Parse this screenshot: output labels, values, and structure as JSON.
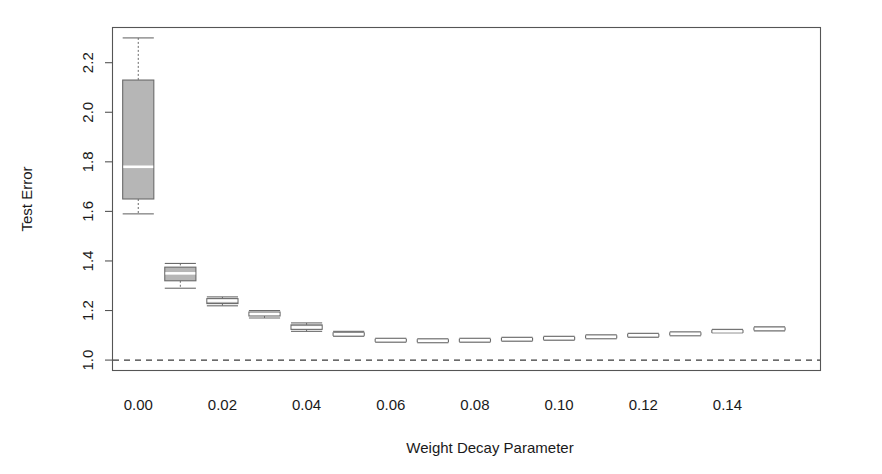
{
  "chart_data": {
    "type": "box",
    "title": "",
    "xlabel": "Weight Decay Parameter",
    "ylabel": "Test Error",
    "grid": false,
    "legend": "none",
    "xlim": [
      -0.006,
      0.162
    ],
    "ylim": [
      0.96,
      2.34
    ],
    "x_tick_labels": [
      "0.00",
      "0.02",
      "0.04",
      "0.06",
      "0.08",
      "0.10",
      "0.12",
      "0.14"
    ],
    "x_tick_values": [
      0.0,
      0.02,
      0.04,
      0.06,
      0.08,
      0.1,
      0.12,
      0.14
    ],
    "y_tick_labels": [
      "1.0",
      "1.2",
      "1.4",
      "1.6",
      "1.8",
      "2.0",
      "2.2"
    ],
    "y_tick_values": [
      1.0,
      1.2,
      1.4,
      1.6,
      1.8,
      2.0,
      2.2
    ],
    "reference_line": {
      "y": 1.0,
      "style": "dashed"
    },
    "box_width": 0.0037,
    "boxes": [
      {
        "x": 0.0,
        "whisker_low": 1.59,
        "q1": 1.65,
        "median": 1.78,
        "q3": 2.13,
        "whisker_high": 2.3
      },
      {
        "x": 0.01,
        "whisker_low": 1.29,
        "q1": 1.32,
        "median": 1.35,
        "q3": 1.375,
        "whisker_high": 1.39
      },
      {
        "x": 0.02,
        "whisker_low": 1.219,
        "q1": 1.228,
        "median": 1.24,
        "q3": 1.248,
        "whisker_high": 1.255
      },
      {
        "x": 0.03,
        "whisker_low": 1.17,
        "q1": 1.178,
        "median": 1.186,
        "q3": 1.194,
        "whisker_high": 1.2
      },
      {
        "x": 0.04,
        "whisker_low": 1.116,
        "q1": 1.124,
        "median": 1.132,
        "q3": 1.142,
        "whisker_high": 1.15
      },
      {
        "x": 0.05,
        "whisker_low": 1.096,
        "q1": 1.1,
        "median": 1.104,
        "q3": 1.11,
        "whisker_high": 1.116
      },
      {
        "x": 0.06,
        "whisker_low": 1.072,
        "q1": 1.076,
        "median": 1.08,
        "q3": 1.084,
        "whisker_high": 1.088
      },
      {
        "x": 0.07,
        "whisker_low": 1.07,
        "q1": 1.074,
        "median": 1.078,
        "q3": 1.082,
        "whisker_high": 1.086
      },
      {
        "x": 0.08,
        "whisker_low": 1.072,
        "q1": 1.076,
        "median": 1.08,
        "q3": 1.084,
        "whisker_high": 1.088
      },
      {
        "x": 0.09,
        "whisker_low": 1.076,
        "q1": 1.08,
        "median": 1.084,
        "q3": 1.088,
        "whisker_high": 1.092
      },
      {
        "x": 0.1,
        "whisker_low": 1.08,
        "q1": 1.084,
        "median": 1.088,
        "q3": 1.092,
        "whisker_high": 1.096
      },
      {
        "x": 0.11,
        "whisker_low": 1.086,
        "q1": 1.09,
        "median": 1.094,
        "q3": 1.098,
        "whisker_high": 1.102
      },
      {
        "x": 0.12,
        "whisker_low": 1.092,
        "q1": 1.096,
        "median": 1.1,
        "q3": 1.104,
        "whisker_high": 1.108
      },
      {
        "x": 0.13,
        "whisker_low": 1.098,
        "q1": 1.102,
        "median": 1.106,
        "q3": 1.11,
        "whisker_high": 1.114
      },
      {
        "x": 0.14,
        "whisker_low": 1.11,
        "q1": 1.113,
        "median": 1.116,
        "q3": 1.12,
        "whisker_high": 1.124
      },
      {
        "x": 0.15,
        "whisker_low": 1.118,
        "q1": 1.122,
        "median": 1.126,
        "q3": 1.13,
        "whisker_high": 1.134
      }
    ]
  },
  "colors": {
    "box_fill": "#b6b6b6",
    "box_stroke": "#6a6a6a",
    "median": "#ffffff",
    "axis": "#555555",
    "reference": "#3a3a3a",
    "background": "#ffffff"
  }
}
